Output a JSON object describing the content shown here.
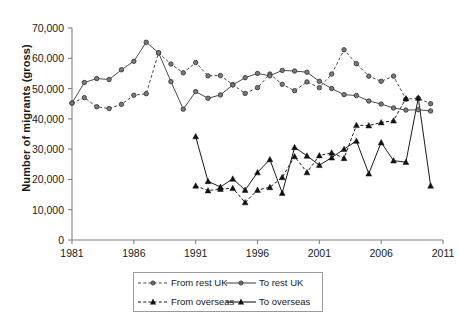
{
  "chart_data": {
    "type": "line",
    "title": "",
    "xlabel": "",
    "ylabel": "Number of migrants (gross)",
    "xlim": [
      1981,
      2011
    ],
    "ylim": [
      0,
      70000
    ],
    "grid": false,
    "legend_position": "bottom",
    "xticks": [
      "1981",
      "1986",
      "1991",
      "1996",
      "2001",
      "2006",
      "2011"
    ],
    "yticks": [
      "0",
      "10,000",
      "20,000",
      "30,000",
      "40,000",
      "50,000",
      "60,000",
      "70,000"
    ],
    "ytick_values": [
      0,
      10000,
      20000,
      30000,
      40000,
      50000,
      60000,
      70000
    ],
    "xtick_values": [
      1981,
      1986,
      1991,
      1996,
      2001,
      2006,
      2011
    ],
    "series": [
      {
        "name": "From rest UK",
        "marker": "circle",
        "line": "dashed",
        "color": "#4d4d4d",
        "x": [
          1981,
          1982,
          1983,
          1984,
          1985,
          1986,
          1987,
          1988,
          1989,
          1990,
          1991,
          1992,
          1993,
          1994,
          1995,
          1996,
          1997,
          1998,
          1999,
          2000,
          2001,
          2002,
          2003,
          2004,
          2005,
          2006,
          2007,
          2008,
          2009,
          2010
        ],
        "values": [
          45200,
          47000,
          44000,
          43400,
          44800,
          47800,
          48300,
          61800,
          58100,
          55200,
          58600,
          54200,
          54300,
          51300,
          48400,
          50300,
          54800,
          51400,
          49300,
          52200,
          50300,
          54800,
          62800,
          58200,
          54100,
          52400,
          54100,
          46500,
          46800,
          45000
        ]
      },
      {
        "name": "To rest UK",
        "marker": "circle",
        "line": "solid",
        "color": "#4d4d4d",
        "x": [
          1981,
          1982,
          1983,
          1984,
          1985,
          1986,
          1987,
          1988,
          1989,
          1990,
          1991,
          1992,
          1993,
          1994,
          1995,
          1996,
          1997,
          1998,
          1999,
          2000,
          2001,
          2002,
          2003,
          2004,
          2005,
          2006,
          2007,
          2008,
          2009,
          2010
        ],
        "values": [
          45200,
          52000,
          53300,
          53000,
          56200,
          59000,
          65300,
          61800,
          52300,
          43200,
          49000,
          46800,
          47900,
          51200,
          53600,
          55000,
          54200,
          56000,
          55800,
          55400,
          52400,
          50000,
          48000,
          47700,
          45900,
          44900,
          43600,
          42900,
          43000,
          42600
        ]
      },
      {
        "name": "From overseas",
        "marker": "triangle",
        "line": "dashed",
        "color": "#1a1a1a",
        "x": [
          1991,
          1992,
          1993,
          1994,
          1995,
          1996,
          1997,
          1998,
          1999,
          2000,
          2001,
          2002,
          2003,
          2004,
          2005,
          2006,
          2007,
          2008
        ],
        "values": [
          17900,
          16300,
          16800,
          17100,
          12400,
          16500,
          17400,
          20700,
          27600,
          22300,
          27900,
          28800,
          27000,
          37900,
          37800,
          38800,
          39400,
          46700
        ]
      },
      {
        "name": "To overseas",
        "marker": "triangle",
        "line": "solid",
        "color": "#1a1a1a",
        "x": [
          1991,
          1992,
          1993,
          1994,
          1995,
          1996,
          1997,
          1998,
          1999,
          2000,
          2001,
          2002,
          2003,
          2004,
          2005,
          2006,
          2007,
          2008,
          2009,
          2010
        ],
        "values": [
          34200,
          19400,
          17500,
          20200,
          16500,
          22300,
          26600,
          15500,
          30600,
          27800,
          24700,
          27200,
          30000,
          32700,
          21900,
          32200,
          26200,
          25700,
          46900,
          17900
        ]
      }
    ]
  },
  "legend": {
    "items": [
      {
        "label": "From rest UK",
        "marker": "circle",
        "line": "dashed"
      },
      {
        "label": "To rest UK",
        "marker": "circle",
        "line": "solid"
      },
      {
        "label": "From overseas",
        "marker": "triangle",
        "line": "dashed"
      },
      {
        "label": "To overseas",
        "marker": "triangle",
        "line": "solid"
      }
    ]
  },
  "axes": {
    "ylabel": "Number of migrants (gross)"
  }
}
